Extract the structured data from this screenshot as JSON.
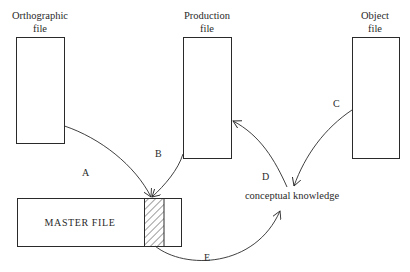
{
  "diagram": {
    "files": {
      "orthographic": {
        "line1": "Orthographic",
        "line2": "file"
      },
      "production": {
        "line1": "Production",
        "line2": "file"
      },
      "object": {
        "line1": "Object",
        "line2": "file"
      }
    },
    "master_file": {
      "label": "MASTER FILE"
    },
    "concept": {
      "label": "conceptual knowledge"
    },
    "arrows": [
      {
        "id": "A",
        "label": "A",
        "from": "Orthographic file",
        "to": "MASTER FILE (hatched entry)"
      },
      {
        "id": "B",
        "label": "B",
        "from": "Production file",
        "to": "MASTER FILE (hatched entry)"
      },
      {
        "id": "C",
        "label": "C",
        "from": "Object file",
        "to": "conceptual knowledge"
      },
      {
        "id": "D",
        "label": "D",
        "from": "conceptual knowledge",
        "to": "Production file"
      },
      {
        "id": "E",
        "label": "E",
        "from": "MASTER FILE (hatched entry)",
        "to": "conceptual knowledge"
      }
    ],
    "colors": {
      "ink": "#2a2a2a",
      "background": "#ffffff"
    }
  }
}
